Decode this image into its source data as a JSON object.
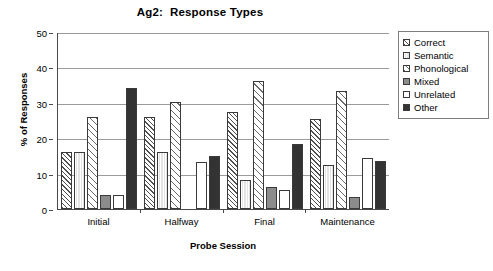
{
  "chart_data": {
    "type": "bar",
    "title": "Ag2:  Response Types",
    "xlabel": "Probe Session",
    "ylabel": "% of Responses",
    "categories": [
      "Initial",
      "Halfway",
      "Final",
      "Maintenance"
    ],
    "ylim": [
      0,
      50
    ],
    "yticks": [
      "0",
      "10",
      "20",
      "30",
      "40",
      "50"
    ],
    "grid": "horizontal",
    "legend_position": "right",
    "series": [
      {
        "name": "Correct",
        "pattern": "diagonal-hatch-dense",
        "color": "#ffffff",
        "values": [
          16.1,
          26.1,
          27.4,
          25.4
        ]
      },
      {
        "name": "Semantic",
        "pattern": "light-gray-fill",
        "color": "#e3e3e3",
        "values": [
          16.1,
          16.2,
          8.2,
          12.3
        ]
      },
      {
        "name": "Phonological",
        "pattern": "diagonal-hatch-sparse",
        "color": "#ffffff",
        "values": [
          26.0,
          30.2,
          36.3,
          33.4
        ]
      },
      {
        "name": "Mixed",
        "pattern": "solid-gray",
        "color": "#8c8c8c",
        "values": [
          4.0,
          0,
          6.2,
          3.4
        ]
      },
      {
        "name": "Unrelated",
        "pattern": "white-fill",
        "color": "#ffffff",
        "values": [
          4.1,
          13.2,
          5.3,
          14.4
        ]
      },
      {
        "name": "Other",
        "pattern": "solid-dark",
        "color": "#333333",
        "values": [
          34.1,
          15.1,
          18.3,
          13.5
        ]
      }
    ]
  },
  "legend": {
    "items": [
      {
        "label": "Correct"
      },
      {
        "label": "Semantic"
      },
      {
        "label": "Phonological"
      },
      {
        "label": "Mixed"
      },
      {
        "label": "Unrelated"
      },
      {
        "label": "Other"
      }
    ]
  }
}
